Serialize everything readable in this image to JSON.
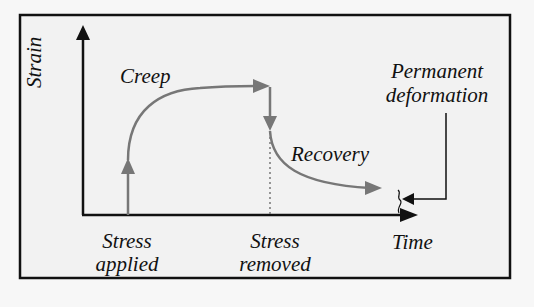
{
  "diagram": {
    "title": "",
    "type": "creep-recovery-diagram",
    "axes": {
      "y_label": "Strain",
      "x_label": "Time"
    },
    "labels": {
      "creep": "Creep",
      "recovery": "Recovery",
      "permanent_line1": "Permanent",
      "permanent_line2": "deformation",
      "stress_applied_line1": "Stress",
      "stress_applied_line2": "applied",
      "stress_removed_line1": "Stress",
      "stress_removed_line2": "removed"
    },
    "colors": {
      "background": "#f7f7f7",
      "axis": "#111111",
      "curve": "#777777",
      "frame": "#111111"
    },
    "phases": [
      {
        "name": "Stress applied",
        "description": "instantaneous elastic strain jump"
      },
      {
        "name": "Creep",
        "description": "strain increases over time under constant stress"
      },
      {
        "name": "Stress removed",
        "description": "instantaneous elastic recovery drop"
      },
      {
        "name": "Recovery",
        "description": "gradual decrease of strain over time"
      },
      {
        "name": "Permanent deformation",
        "description": "residual strain remaining"
      }
    ]
  }
}
